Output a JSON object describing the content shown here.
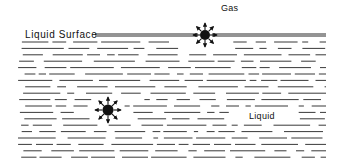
{
  "labels": {
    "gas": "Gas",
    "liquid_surface": "Liquid Surface",
    "liquid": "Liquid"
  },
  "colors": {
    "ink": "#111111",
    "background": "#ffffff"
  },
  "surface_line": {
    "x1": 95,
    "x2": 326,
    "y": 35
  },
  "bubbles": [
    {
      "name": "surface-bubble",
      "cx": 205,
      "cy": 35,
      "r": 5,
      "arrow_len": 12,
      "arrows": 8
    },
    {
      "name": "bulk-bubble",
      "cx": 108,
      "cy": 110,
      "r": 5.5,
      "arrow_len": 13,
      "arrows": 8
    }
  ],
  "liquid_region": {
    "x1": 18,
    "x2": 326,
    "y_start": 42,
    "y_end": 161,
    "row_spacing": 6.4
  }
}
